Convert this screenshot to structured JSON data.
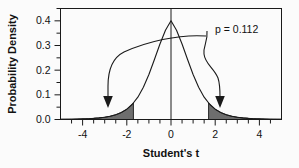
{
  "chart_data": {
    "type": "area",
    "title": "",
    "xlabel": "Student's t",
    "ylabel": "Probability Density",
    "xlim": [
      -5,
      5
    ],
    "ylim": [
      0.0,
      0.45
    ],
    "grid": false,
    "legend": "none",
    "distribution": "Student's t density",
    "degrees_of_freedom": 8,
    "peak_value": 0.4,
    "x_ticks_major": [
      -4,
      -2,
      0,
      2,
      4
    ],
    "x_tick_labels": [
      "-4",
      "-2",
      "0",
      "2",
      "4"
    ],
    "x_ticks_minor": [
      -4.5,
      -3.5,
      -3,
      -2.5,
      -1.5,
      -1,
      -0.5,
      0.5,
      1,
      1.5,
      2.5,
      3,
      3.5,
      4.5
    ],
    "y_ticks_major": [
      0.0,
      0.1,
      0.2,
      0.3,
      0.4
    ],
    "y_tick_labels": [
      "0.0",
      "0.1",
      "0.2",
      "0.3",
      "0.4"
    ],
    "y_ticks_minor": [
      0.05,
      0.15,
      0.25,
      0.35,
      0.45
    ],
    "critical_values": [
      -1.7,
      1.7
    ],
    "shaded_regions": [
      {
        "name": "left-tail",
        "from": -5,
        "to": -1.7,
        "fill": "#6e6e6e"
      },
      {
        "name": "right-tail",
        "from": 1.7,
        "to": 5,
        "fill": "#6e6e6e"
      }
    ],
    "reference_line_x": 0,
    "annotations": [
      {
        "name": "p-value-label",
        "text": "p = 0.112",
        "x": 2.6,
        "y": 0.37
      }
    ],
    "arrows": [
      {
        "name": "left-tail-arrow",
        "points_to": "left-tail",
        "tip_x": -2.35,
        "tip_y": 0.09
      },
      {
        "name": "right-tail-arrow",
        "points_to": "right-tail",
        "tip_x": 2.6,
        "tip_y": 0.09
      }
    ],
    "curve_points_x": [
      -5,
      -4.75,
      -4.5,
      -4.25,
      -4,
      -3.75,
      -3.5,
      -3.25,
      -3,
      -2.75,
      -2.5,
      -2.25,
      -2,
      -1.75,
      -1.5,
      -1.25,
      -1,
      -0.75,
      -0.5,
      -0.25,
      0,
      0.25,
      0.5,
      0.75,
      1,
      1.25,
      1.5,
      1.75,
      2,
      2.25,
      2.5,
      2.75,
      3,
      3.25,
      3.5,
      3.75,
      4,
      4.25,
      4.5,
      4.75,
      5
    ],
    "curve_points_y": [
      0.0013,
      0.0017,
      0.0023,
      0.0031,
      0.0042,
      0.0058,
      0.0081,
      0.0114,
      0.0162,
      0.0233,
      0.0339,
      0.0497,
      0.0734,
      0.1085,
      0.1592,
      0.2294,
      0.3203,
      0.4273,
      0.5384,
      0.6365,
      0.7032,
      0.6365,
      0.5384,
      0.4273,
      0.3203,
      0.2294,
      0.1592,
      0.1085,
      0.0734,
      0.0497,
      0.0339,
      0.0233,
      0.0162,
      0.0114,
      0.0081,
      0.0058,
      0.0042,
      0.0031,
      0.0023,
      0.0017,
      0.0013
    ]
  },
  "axes": {
    "x_title": "Student's t",
    "y_title": "Probability Density",
    "x_labels": [
      "-4",
      "-2",
      "0",
      "2",
      "4"
    ],
    "y_labels": [
      "0.0",
      "0.1",
      "0.2",
      "0.3",
      "0.4"
    ]
  },
  "annotation": {
    "p_value_text": "p = 0.112"
  }
}
